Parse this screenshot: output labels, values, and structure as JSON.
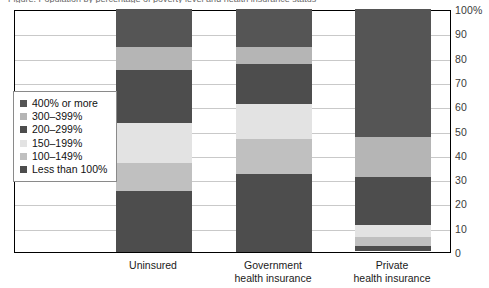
{
  "caption": {
    "text": "Figure: Population by percentage of poverty level and health insurance status"
  },
  "chart_data": {
    "type": "bar",
    "title": "",
    "subtitle": "",
    "xlabel": "",
    "ylabel": "",
    "stacked": true,
    "stack_mode": "percent",
    "orientation": "vertical",
    "grid": true,
    "legend_position": "inside-left",
    "ylim": [
      0,
      100
    ],
    "ytick_labels": [
      "100%",
      "90",
      "80",
      "70",
      "60",
      "50",
      "40",
      "30",
      "20",
      "10",
      "0"
    ],
    "ytick_values": [
      100,
      90,
      80,
      70,
      60,
      50,
      40,
      30,
      20,
      10,
      0
    ],
    "categories": [
      "Uninsured",
      "Government health insurance",
      "Private health insurance"
    ],
    "category_lines": [
      [
        "Uninsured"
      ],
      [
        "Government",
        "health insurance"
      ],
      [
        "Private",
        "health insurance"
      ]
    ],
    "series": [
      {
        "name": "Less than 100%",
        "color": "#4d4d4d",
        "values": [
          25.0,
          32.0,
          2.0
        ]
      },
      {
        "name": "100–149%",
        "color": "#c0c0c0",
        "values": [
          11.5,
          14.5,
          3.5
        ]
      },
      {
        "name": "150–199%",
        "color": "#e3e3e3",
        "values": [
          16.5,
          14.5,
          5.0
        ]
      },
      {
        "name": "200–299%",
        "color": "#4d4d4d",
        "values": [
          22.0,
          16.5,
          20.0
        ]
      },
      {
        "name": "300–399%",
        "color": "#b5b5b5",
        "values": [
          9.5,
          7.0,
          16.5
        ]
      },
      {
        "name": "400% or more",
        "color": "#555555",
        "values": [
          15.5,
          15.5,
          52.5
        ]
      }
    ],
    "legend_entries": [
      {
        "label": "400% or more",
        "color": "#555555"
      },
      {
        "label": "300–399%",
        "color": "#b5b5b5"
      },
      {
        "label": "200–299%",
        "color": "#4d4d4d"
      },
      {
        "label": "150–199%",
        "color": "#e3e3e3"
      },
      {
        "label": "100–149%",
        "color": "#c0c0c0"
      },
      {
        "label": "Less than 100%",
        "color": "#4d4d4d"
      }
    ],
    "colors": {
      "axis": "#000000",
      "gridline": "#c9c9c9",
      "background": "#ffffff",
      "tick_text": "#3a3a3a",
      "label_text": "#1a1a1a"
    }
  }
}
